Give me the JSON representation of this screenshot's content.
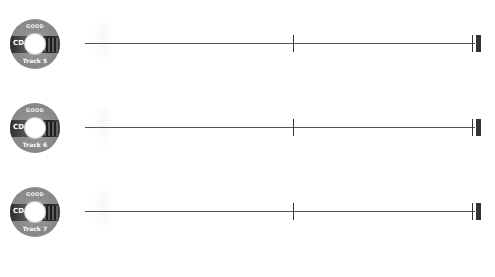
{
  "tracks": [
    {
      "disc_title": "GOOD",
      "disc_label": "CD 2",
      "track_label": "Track 5"
    },
    {
      "disc_title": "GOOD",
      "disc_label": "CD 2",
      "track_label": "Track 6"
    },
    {
      "disc_title": "GOOD",
      "disc_label": "CD 2",
      "track_label": "Track 7"
    }
  ],
  "colors": {
    "line": "#555555",
    "tick": "#333333",
    "background": "#ffffff"
  }
}
